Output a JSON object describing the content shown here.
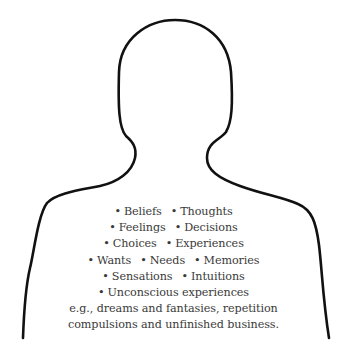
{
  "figure": {
    "outline_color": "#111111",
    "text_color": "#3a3a3a",
    "bullet_glyph": "•",
    "lines": [
      {
        "items": [
          "Beliefs",
          "Thoughts"
        ]
      },
      {
        "items": [
          "Feelings",
          "Decisions"
        ]
      },
      {
        "items": [
          "Choices",
          "Experiences"
        ]
      },
      {
        "items": [
          "Wants",
          "Needs",
          "Memories"
        ]
      },
      {
        "items": [
          "Sensations",
          "Intuitions"
        ]
      },
      {
        "items": [
          "Unconscious experiences"
        ]
      }
    ],
    "note_lines": [
      "e.g., dreams and fantasies, repetition",
      "compulsions and unfinished business."
    ]
  }
}
